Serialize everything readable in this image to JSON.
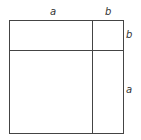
{
  "figure": {
    "labels": {
      "top_a": "a",
      "top_b": "b",
      "right_b": "b",
      "right_a": "a"
    },
    "stroke_color": "#444444",
    "geometry": {
      "left": 9.5,
      "top": 20.5,
      "right": 123.5,
      "bottom": 133.5,
      "vertical_divider_x": 92.5,
      "horizontal_divider_y": 50.5
    }
  }
}
